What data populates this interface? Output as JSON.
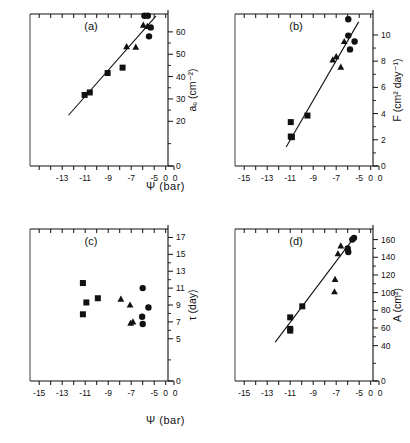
{
  "figure": {
    "x_axis_label_top_row": "Ψ  (bar)",
    "x_axis_label_bottom_row": "Ψ  (bar)"
  },
  "chart_data": [
    {
      "type": "scatter",
      "panel": "a",
      "title": "(a)",
      "xlabel": "Ψ (bar)",
      "ylabel": "aₑ (cm⁻²)",
      "xlim": [
        -15.8,
        -3.8
      ],
      "ylim": [
        0,
        68
      ],
      "xticks": [
        -15,
        -14,
        -13,
        -12,
        -11,
        -10,
        -9,
        -8,
        -7,
        -6,
        -5,
        -4
      ],
      "xticklabels": [
        "",
        "",
        "-13",
        "",
        "-11",
        "",
        "-9",
        "",
        "-7",
        "",
        "-5",
        "0"
      ],
      "yticks": [
        0,
        20,
        30,
        40,
        50,
        60
      ],
      "yticklabels": [
        "0",
        "20",
        "30",
        "40",
        "50",
        "60"
      ],
      "grid": false,
      "legend": "none",
      "has_fit_line": true,
      "fit_line": {
        "x1": -12.45,
        "y1": 22.7,
        "x2": -4.85,
        "y2": 67.0
      },
      "series": [
        {
          "name": "squares",
          "marker": "square",
          "points": [
            {
              "x": -11.05,
              "y": 31.8
            },
            {
              "x": -10.6,
              "y": 32.9
            },
            {
              "x": -9.05,
              "y": 41.6
            },
            {
              "x": -7.75,
              "y": 44.0
            }
          ]
        },
        {
          "name": "triangles",
          "marker": "triangle",
          "points": [
            {
              "x": -7.4,
              "y": 53.4
            },
            {
              "x": -6.6,
              "y": 53.2
            },
            {
              "x": -5.95,
              "y": 63.0
            },
            {
              "x": -5.6,
              "y": 62.5
            }
          ]
        },
        {
          "name": "circles",
          "marker": "circle",
          "points": [
            {
              "x": -5.85,
              "y": 67.2
            },
            {
              "x": -5.55,
              "y": 67.2
            },
            {
              "x": -5.3,
              "y": 62.0
            },
            {
              "x": -5.45,
              "y": 58.0
            }
          ]
        }
      ]
    },
    {
      "type": "scatter",
      "panel": "b",
      "title": "(b)",
      "xlabel": "Ψ (bar)",
      "ylabel": "F (cm² day⁻¹)",
      "xlim": [
        -15.8,
        -3.8
      ],
      "ylim": [
        0,
        11.6
      ],
      "xticks": [
        -15,
        -14,
        -13,
        -12,
        -11,
        -10,
        -9,
        -8,
        -7,
        -6,
        -5,
        -4
      ],
      "xticklabels": [
        "-15",
        "",
        "-13",
        "",
        "-11",
        "",
        "-9",
        "",
        "-7",
        "",
        "-5",
        "0"
      ],
      "yticks": [
        0,
        2,
        4,
        6,
        8,
        10
      ],
      "yticklabels": [
        "0",
        "2",
        "4",
        "6",
        "8",
        "10"
      ],
      "grid": false,
      "legend": "none",
      "has_fit_line": true,
      "fit_line": {
        "x1": -11.35,
        "y1": 1.45,
        "x2": -5.05,
        "y2": 11.0
      },
      "series": [
        {
          "name": "squares",
          "marker": "square",
          "points": [
            {
              "x": -10.95,
              "y": 3.35
            },
            {
              "x": -10.95,
              "y": 2.25
            },
            {
              "x": -10.85,
              "y": 2.2
            },
            {
              "x": -9.5,
              "y": 3.85
            }
          ]
        },
        {
          "name": "triangles",
          "marker": "triangle",
          "points": [
            {
              "x": -7.3,
              "y": 8.1
            },
            {
              "x": -7.0,
              "y": 8.35
            },
            {
              "x": -6.6,
              "y": 7.55
            },
            {
              "x": -6.3,
              "y": 9.5
            }
          ]
        },
        {
          "name": "circles",
          "marker": "circle",
          "points": [
            {
              "x": -5.95,
              "y": 11.2
            },
            {
              "x": -5.95,
              "y": 9.95
            },
            {
              "x": -5.8,
              "y": 8.9
            },
            {
              "x": -5.4,
              "y": 9.5
            }
          ]
        }
      ]
    },
    {
      "type": "scatter",
      "panel": "c",
      "title": "(c)",
      "xlabel": "Ψ (bar)",
      "ylabel": "τ (day)",
      "xlim": [
        -15.8,
        -3.8
      ],
      "ylim": [
        0,
        18
      ],
      "xticks": [
        -15,
        -14,
        -13,
        -12,
        -11,
        -10,
        -9,
        -8,
        -7,
        -6,
        -5,
        -4
      ],
      "xticklabels": [
        "-15",
        "",
        "-13",
        "",
        "-11",
        "",
        "-9",
        "",
        "-7",
        "",
        "-5",
        "0"
      ],
      "yticks": [
        0,
        5,
        7,
        9,
        11,
        13,
        15,
        17
      ],
      "yticklabels": [
        "0",
        "5",
        "7",
        "9",
        "11",
        "13",
        "15",
        "17"
      ],
      "grid": false,
      "legend": "none",
      "has_fit_line": false,
      "series": [
        {
          "name": "squares",
          "marker": "square",
          "points": [
            {
              "x": -11.2,
              "y": 11.6
            },
            {
              "x": -10.9,
              "y": 9.3
            },
            {
              "x": -11.2,
              "y": 7.9
            },
            {
              "x": -9.9,
              "y": 9.8
            }
          ]
        },
        {
          "name": "triangles",
          "marker": "triangle",
          "points": [
            {
              "x": -7.9,
              "y": 9.7
            },
            {
              "x": -7.1,
              "y": 9.0
            },
            {
              "x": -7.05,
              "y": 6.85
            },
            {
              "x": -6.85,
              "y": 7.0
            }
          ]
        },
        {
          "name": "circles",
          "marker": "circle",
          "points": [
            {
              "x": -6.0,
              "y": 11.0
            },
            {
              "x": -5.5,
              "y": 8.7
            },
            {
              "x": -6.05,
              "y": 7.6
            },
            {
              "x": -6.0,
              "y": 6.75
            }
          ]
        }
      ]
    },
    {
      "type": "scatter",
      "panel": "d",
      "title": "(d)",
      "xlabel": "Ψ (bar)",
      "ylabel": "A (cm²)",
      "xlim": [
        -15.8,
        -3.8
      ],
      "ylim": [
        0,
        172
      ],
      "xticks": [
        -15,
        -14,
        -13,
        -12,
        -11,
        -10,
        -9,
        -8,
        -7,
        -6,
        -5,
        -4
      ],
      "xticklabels": [
        "-15",
        "",
        "-13",
        "",
        "-11",
        "",
        "-9",
        "",
        "-7",
        "",
        "-5",
        "0"
      ],
      "yticks": [
        0,
        40,
        60,
        80,
        100,
        120,
        140,
        160
      ],
      "yticklabels": [
        "0",
        "40",
        "60",
        "80",
        "100",
        "120",
        "140",
        "160"
      ],
      "grid": false,
      "legend": "none",
      "has_fit_line": true,
      "fit_line": {
        "x1": -12.3,
        "y1": 44.0,
        "x2": -5.35,
        "y2": 164.0
      },
      "series": [
        {
          "name": "squares",
          "marker": "square",
          "points": [
            {
              "x": -11.0,
              "y": 72.0
            },
            {
              "x": -11.0,
              "y": 59.0
            },
            {
              "x": -11.0,
              "y": 57.0
            },
            {
              "x": -9.95,
              "y": 84.5
            }
          ]
        },
        {
          "name": "triangles",
          "marker": "triangle",
          "points": [
            {
              "x": -7.1,
              "y": 115.0
            },
            {
              "x": -7.15,
              "y": 101.0
            },
            {
              "x": -6.85,
              "y": 144.0
            },
            {
              "x": -6.6,
              "y": 153.0
            }
          ]
        },
        {
          "name": "circles",
          "marker": "circle",
          "points": [
            {
              "x": -5.95,
              "y": 146.0
            },
            {
              "x": -6.0,
              "y": 150.0
            },
            {
              "x": -5.6,
              "y": 160.0
            },
            {
              "x": -5.45,
              "y": 162.0
            }
          ]
        }
      ]
    }
  ]
}
